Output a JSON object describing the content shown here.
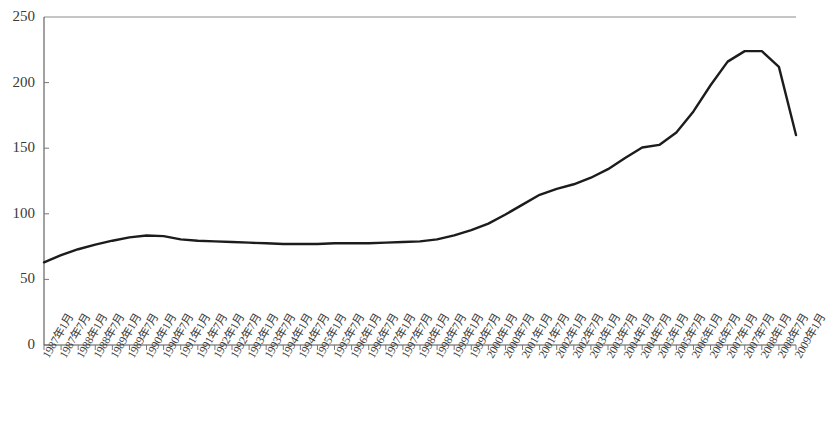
{
  "chart_data": {
    "type": "line",
    "title": "",
    "subtitle": "",
    "xlabel": "",
    "ylabel": "",
    "legend": [],
    "grid": false,
    "legend_position": "none",
    "ylim": [
      0,
      250
    ],
    "yticks": [
      0,
      50,
      100,
      150,
      200,
      250
    ],
    "ytick_labels": [
      "0",
      "50",
      "100",
      "150",
      "200",
      "250"
    ],
    "categories": [
      "1987年1月",
      "1987年7月",
      "1988年1月",
      "1988年7月",
      "1989年1月",
      "1989年7月",
      "1990年1月",
      "1990年7月",
      "1991年1月",
      "1991年7月",
      "1992年1月",
      "1992年7月",
      "1993年1月",
      "1993年7月",
      "1994年1月",
      "1994年7月",
      "1995年1月",
      "1995年7月",
      "1996年1月",
      "1996年7月",
      "1997年1月",
      "1997年7月",
      "1998年1月",
      "1998年7月",
      "1999年1月",
      "1999年7月",
      "2000年1月",
      "2000年7月",
      "2001年1月",
      "2001年7月",
      "2002年1月",
      "2002年7月",
      "2003年1月",
      "2003年7月",
      "2004年1月",
      "2004年7月",
      "2005年1月",
      "2005年7月",
      "2006年1月",
      "2006年7月",
      "2007年1月",
      "2007年7月",
      "2008年1月",
      "2008年7月",
      "2009年1月"
    ],
    "series": [
      {
        "name": "index",
        "color": "#1c1c1c",
        "values": [
          63.0,
          68.5,
          73.0,
          76.5,
          79.5,
          82.0,
          83.5,
          83.0,
          80.5,
          79.5,
          79.0,
          78.5,
          78.0,
          77.5,
          77.0,
          77.0,
          77.0,
          77.5,
          77.5,
          77.5,
          78.0,
          78.5,
          79.0,
          80.5,
          83.5,
          87.5,
          92.5,
          99.5,
          107.0,
          114.5,
          119.0,
          122.5,
          127.5,
          134.0,
          142.5,
          150.5,
          152.5,
          162.0,
          178.0,
          198.0,
          216.0,
          224.0,
          224.0,
          212.0,
          160.0
        ]
      }
    ]
  },
  "axes": {
    "plot_left": 44,
    "plot_right": 796,
    "plot_top": 17,
    "plot_bottom": 345,
    "axis_color": "#555555",
    "frame_top_color": "#8c8c8c",
    "tick_color": "#777777",
    "line_width": 2.4
  }
}
